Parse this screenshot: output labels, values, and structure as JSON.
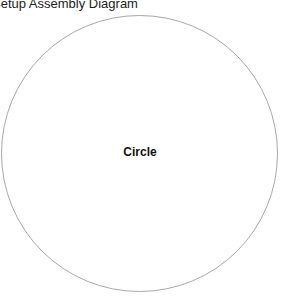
{
  "diagram": {
    "title": "Setup Assembly Diagram",
    "shapes": [
      {
        "type": "circle",
        "label": "Circle",
        "stroke_color": "#a8a8a8"
      }
    ]
  }
}
